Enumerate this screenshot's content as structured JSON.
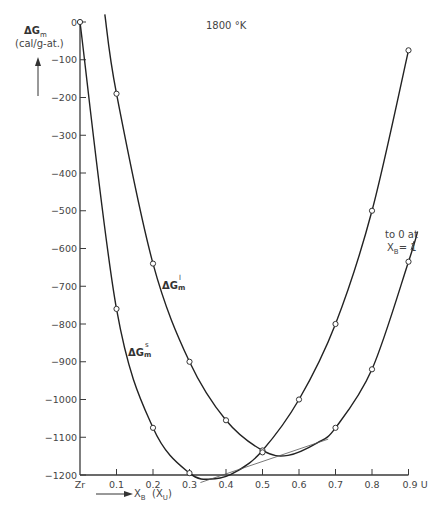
{
  "title": "1800 °K",
  "y_axis": {
    "label_main": "ΔG",
    "label_sub": "m",
    "unit": "(cal/g-at.)",
    "ticks": [
      "0",
      "-100",
      "-200",
      "-300",
      "-400",
      "-500",
      "-600",
      "-700",
      "-800",
      "-900",
      "-1000",
      "-1100",
      "-1200"
    ]
  },
  "x_axis": {
    "label_main": "X",
    "label_sub": "B",
    "label_paren": "(X",
    "label_paren_sub": "U",
    "label_paren_close": ")",
    "ticks": [
      "Zr",
      "0.1",
      "0.2",
      "0.3",
      "0.4",
      "0.5",
      "0.6",
      "0.7",
      "0.8",
      "0.9 U"
    ]
  },
  "annotations": {
    "liquid_label": "ΔG",
    "liquid_sub": "m",
    "liquid_sup": "l",
    "solid_label": "ΔG",
    "solid_sub": "m",
    "solid_sup": "s",
    "note_line1": "to 0 at",
    "note_line2": "X",
    "note_line2_sub": "B",
    "note_line2_rest": "= 1"
  },
  "chart_data": {
    "type": "line",
    "title": "1800 °K",
    "xlabel": "X_B (X_U)",
    "ylabel": "ΔG_m (cal/g-at.)",
    "xlim": [
      0,
      0.9
    ],
    "ylim": [
      -1200,
      0
    ],
    "grid": false,
    "legend": "inline labels",
    "series": [
      {
        "name": "ΔG_m^l",
        "x": [
          0.1,
          0.2,
          0.3,
          0.4,
          0.5,
          0.6,
          0.7,
          0.8,
          0.9
        ],
        "values": [
          -190,
          -640,
          -900,
          -1055,
          -1135,
          -1000,
          -800,
          -500,
          -75
        ]
      },
      {
        "name": "ΔG_m^s",
        "x": [
          0.0,
          0.1,
          0.2,
          0.3,
          0.5,
          0.7,
          0.8,
          0.9
        ],
        "values": [
          0,
          -760,
          -1075,
          -1195,
          -1140,
          -1075,
          -920,
          -635
        ]
      }
    ],
    "annotations": [
      "common tangent line from ~0.33 to ~0.68",
      "to 0 at X_B = 1"
    ]
  }
}
